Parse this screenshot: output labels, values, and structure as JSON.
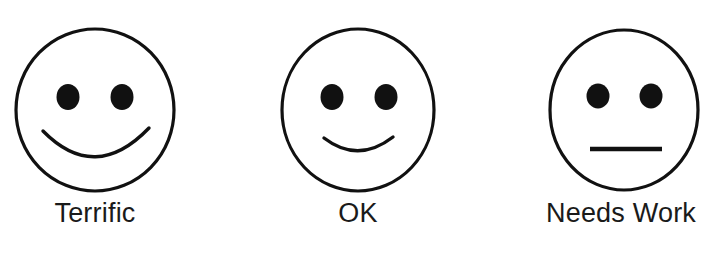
{
  "page": {
    "background_color": "#ffffff",
    "ink_color": "#1a1a1a",
    "width": 714,
    "height": 257
  },
  "cropped_header": {
    "visible_fragment": "partially cropped line of text above figure"
  },
  "scale": {
    "items": [
      {
        "label": "Terrific",
        "icon": "smiley-face-happy-icon",
        "expression": "broad smile",
        "mouth_type": "deep-curve",
        "rating_position": 1
      },
      {
        "label": "OK",
        "icon": "smiley-face-slight-smile-icon",
        "expression": "slight smile",
        "mouth_type": "shallow-curve",
        "rating_position": 2
      },
      {
        "label": "Needs Work",
        "icon": "smiley-face-neutral-icon",
        "expression": "neutral",
        "mouth_type": "straight-line",
        "rating_position": 3
      }
    ]
  }
}
